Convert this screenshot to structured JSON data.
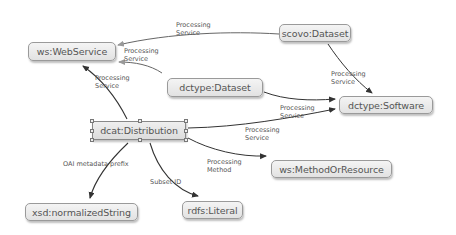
{
  "diagram": {
    "type": "ontology-graph",
    "nodes": [
      {
        "id": "webservice",
        "label": "ws:WebService"
      },
      {
        "id": "scovo_dataset",
        "label": "scovo:Dataset"
      },
      {
        "id": "dctype_dataset",
        "label": "dctype:Dataset"
      },
      {
        "id": "dctype_software",
        "label": "dctype:Software"
      },
      {
        "id": "dcat_distribution",
        "label": "dcat:Distribution",
        "selected": true
      },
      {
        "id": "method_or_resource",
        "label": "ws:MethodOrResource"
      },
      {
        "id": "normalized_string",
        "label": "xsd:normalizedString"
      },
      {
        "id": "rdfs_literal",
        "label": "rdfs:Literal"
      }
    ],
    "edges": [
      {
        "from": "scovo_dataset",
        "to": "webservice",
        "label": "Processing\nService"
      },
      {
        "from": "dctype_dataset",
        "to": "webservice",
        "label": "Processing\nService"
      },
      {
        "from": "dcat_distribution",
        "to": "webservice",
        "label": "Processing\nService"
      },
      {
        "from": "scovo_dataset",
        "to": "dctype_software",
        "label": "Processing\nService"
      },
      {
        "from": "dctype_dataset",
        "to": "dctype_software",
        "label": "Processing\nService"
      },
      {
        "from": "dcat_distribution",
        "to": "dctype_software",
        "label": "Processing\nService"
      },
      {
        "from": "dcat_distribution",
        "to": "method_or_resource",
        "label": "Processing\nMethod"
      },
      {
        "from": "dcat_distribution",
        "to": "normalized_string",
        "label": "OAI metadata prefix"
      },
      {
        "from": "dcat_distribution",
        "to": "rdfs_literal",
        "label": "Subset ID"
      }
    ]
  },
  "colors": {
    "node_fill": "#e8e8e8",
    "node_border": "#9a9a9a",
    "edge": "#333333",
    "edge_to_webservice": "#8a8a8a",
    "text": "#555555"
  }
}
